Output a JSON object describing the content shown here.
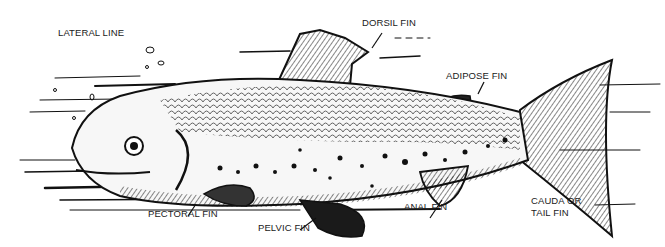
{
  "diagram": {
    "labels": {
      "lateral_line": "LATERAL LINE",
      "dorsal_fin": "DORSIL FIN",
      "adipose_fin": "ADIPOSE FIN",
      "caudal_fin_line1": "CAUDA OR",
      "caudal_fin_line2": "TAIL FIN",
      "anal_fin": "ANAL FIN",
      "pelvic_fin": "PELVIC FIN",
      "pectoral_fin": "PECTORAL FIN"
    },
    "colors": {
      "ink": "#111111",
      "background": "#ffffff"
    }
  }
}
